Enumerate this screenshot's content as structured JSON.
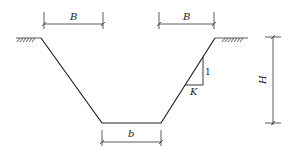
{
  "diagram": {
    "type": "trapezoidal trench cross-section",
    "labels": {
      "top_left_width": "B",
      "top_right_width": "B",
      "bottom_width": "b",
      "depth": "H",
      "slope_vertical": "1",
      "slope_horizontal": "K"
    },
    "colors": {
      "line": "#222222",
      "background": "#ffffff"
    }
  }
}
